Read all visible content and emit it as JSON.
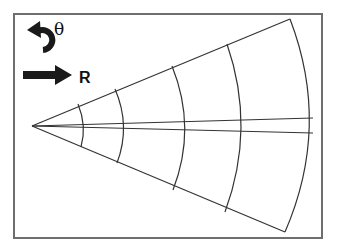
{
  "diagram": {
    "type": "polar-grid-sector",
    "legend": {
      "theta": {
        "symbol": "θ",
        "icon": "curved-arrow-counterclockwise",
        "meaning": "angular direction"
      },
      "r": {
        "symbol": "R",
        "icon": "straight-arrow-right",
        "meaning": "radial direction"
      }
    },
    "apex": [
      32,
      126
    ],
    "frame": {
      "x": 14,
      "y": 14,
      "width": 308,
      "height": 224
    },
    "arcs_count": 5,
    "center_lines_count": 2,
    "colors": {
      "line": "#333333",
      "frame": "#6e6e6e",
      "background": "#ffffff",
      "icon": "#1a1a1a"
    }
  }
}
